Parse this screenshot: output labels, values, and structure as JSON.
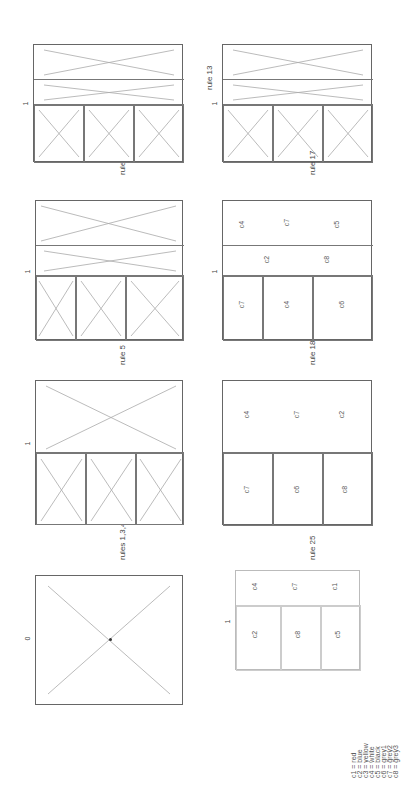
{
  "figure": {
    "orientation": "rotated 90 degrees counter-clockwise",
    "panels": [
      {
        "id": "p0",
        "step_label": "0",
        "description": "initial rectangle with diagonals"
      },
      {
        "id": "p1",
        "step_label": "1",
        "description": "after rules 1,3,4"
      },
      {
        "id": "p2",
        "step_label": "1",
        "description": "after rule 5"
      },
      {
        "id": "p3",
        "step_label": "1",
        "description": "after rule 8"
      },
      {
        "id": "p4",
        "step_label": "1",
        "description": "after rule 13"
      },
      {
        "id": "p5",
        "step_label": "1",
        "description": "after rule 17 (colored labels)"
      },
      {
        "id": "p6",
        "step_label": "",
        "description": "after rule 18 (colored labels)"
      },
      {
        "id": "p7",
        "step_label": "1",
        "description": "after rule 25 (final colored)"
      }
    ],
    "transitions": [
      {
        "label": "rules 1,3,4"
      },
      {
        "label": "rule 5"
      },
      {
        "label": "rule 8"
      },
      {
        "label": "rule 13"
      },
      {
        "label": "rule 17"
      },
      {
        "label": "rule 18"
      },
      {
        "label": "rule 25"
      }
    ],
    "legend": [
      {
        "key": "c1",
        "value": "red"
      },
      {
        "key": "c2",
        "value": "blue"
      },
      {
        "key": "c3",
        "value": "yellow"
      },
      {
        "key": "c4",
        "value": "white"
      },
      {
        "key": "c5",
        "value": "black"
      },
      {
        "key": "c6",
        "value": "grey1"
      },
      {
        "key": "c7",
        "value": "grey2"
      },
      {
        "key": "c8",
        "value": "grey3"
      }
    ],
    "legend_text": [
      "c1 = red",
      "c2 = blue",
      "c3 = yellow",
      "c4 = white",
      "c5 = black",
      "c6 = grey1",
      "c7 = grey2",
      "c8 = grey3"
    ],
    "cell_labels": [
      "c1",
      "c2",
      "c3",
      "c4",
      "c5",
      "c6",
      "c7",
      "c8"
    ]
  }
}
